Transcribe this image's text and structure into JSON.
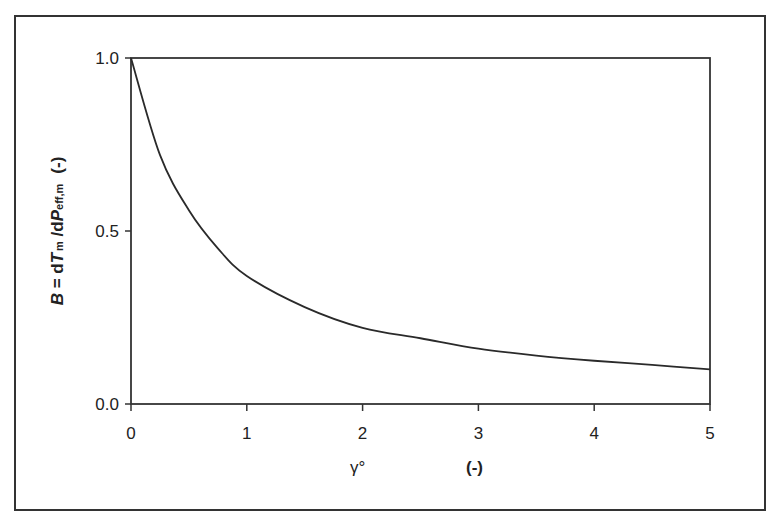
{
  "chart_data": {
    "type": "line",
    "title": "",
    "xlabel": "γ°",
    "xlabel_unit": "(-)",
    "ylabel": "B = dTm / dPeff,m (-)",
    "ylabel_parts": {
      "B": "B",
      "eq": " = d",
      "T": "T",
      "T_sub": "m",
      "slash": " /d",
      "P": "P",
      "P_sub": "eff,m",
      "unit": "(-)"
    },
    "xlim": [
      0,
      5
    ],
    "ylim": [
      0.0,
      1.0
    ],
    "x_ticks": [
      "0",
      "1",
      "2",
      "3",
      "4",
      "5"
    ],
    "y_ticks": [
      "0.0",
      "0.5",
      "1.0"
    ],
    "grid": false,
    "legend": null,
    "series": [
      {
        "name": "B",
        "x": [
          0,
          0.25,
          0.5,
          0.75,
          1,
          1.5,
          2,
          2.5,
          3,
          3.5,
          4,
          4.5,
          5
        ],
        "y": [
          1.0,
          0.72,
          0.56,
          0.45,
          0.37,
          0.28,
          0.22,
          0.19,
          0.16,
          0.14,
          0.125,
          0.113,
          0.1
        ]
      }
    ]
  }
}
